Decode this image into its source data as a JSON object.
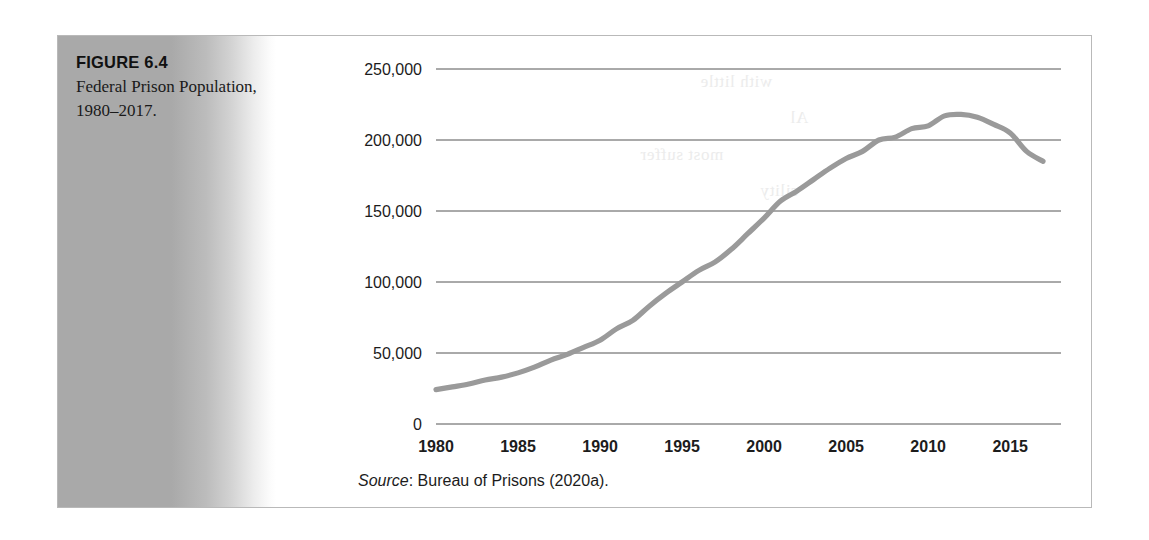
{
  "figure": {
    "caption_title": "FIGURE 6.4",
    "caption_text": "Federal Prison Population, 1980–2017.",
    "source_word": "Source",
    "source_rest": ": Bureau of Prisons (2020a).",
    "frame_color": "#b9b9b9",
    "panel_color": "#a9a9a9",
    "line_color": "#9a9a9a"
  },
  "page_bleed": {
    "lines": [
      "with little",
      "Al",
      "most suffer",
      "cility",
      "ge Security",
      "hey are",
      "a Bureau of",
      "usually reinforce",
      "the BOP's  COs maintain",
      "the highest",
      "the issues"
    ]
  },
  "chart_data": {
    "type": "line",
    "title": "Federal Prison Population, 1980–2017",
    "xlabel": "",
    "ylabel": "",
    "xlim": [
      1980,
      2017
    ],
    "ylim": [
      0,
      250000
    ],
    "grid": true,
    "legend": "none",
    "xticks": [
      1980,
      1985,
      1990,
      1995,
      2000,
      2005,
      2010,
      2015
    ],
    "xtick_labels": [
      "1980",
      "1985",
      "1990",
      "1995",
      "2000",
      "2005",
      "2010",
      "2015"
    ],
    "yticks": [
      0,
      50000,
      100000,
      150000,
      200000,
      250000
    ],
    "ytick_labels": [
      "0",
      "50,000",
      "100,000",
      "150,000",
      "200,000",
      "250,000"
    ],
    "series": [
      {
        "name": "Federal prison population",
        "color": "#9a9a9a",
        "x": [
          1980,
          1981,
          1982,
          1983,
          1984,
          1985,
          1986,
          1987,
          1988,
          1989,
          1990,
          1991,
          1992,
          1993,
          1994,
          1995,
          1996,
          1997,
          1998,
          1999,
          2000,
          2001,
          2002,
          2003,
          2004,
          2005,
          2006,
          2007,
          2008,
          2009,
          2010,
          2011,
          2012,
          2013,
          2014,
          2015,
          2016,
          2017
        ],
        "values": [
          24252,
          26150,
          28133,
          31000,
          33000,
          36000,
          40000,
          45000,
          49000,
          54000,
          59000,
          67000,
          73000,
          83000,
          92000,
          100000,
          108000,
          114000,
          123000,
          134000,
          145000,
          157000,
          164000,
          172000,
          180000,
          187000,
          192000,
          200000,
          202000,
          208000,
          210000,
          217000,
          218000,
          216000,
          211000,
          205000,
          192000,
          185000
        ]
      }
    ]
  }
}
